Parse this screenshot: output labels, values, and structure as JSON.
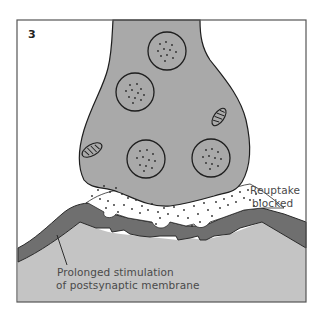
{
  "figure": {
    "panel_number": "3",
    "labels": {
      "reuptake_line1": "Reuptake",
      "reuptake_line2": "blocked",
      "stimulation_line1": "Prolonged stimulation",
      "stimulation_line2": "of postsynaptic membrane"
    },
    "structures": [
      "presynaptic-terminal",
      "synaptic-vesicles",
      "mitochondria",
      "neurotransmitter-molecules",
      "postsynaptic-membrane",
      "postsynaptic-cell"
    ],
    "colors": {
      "background": "#ffffff",
      "terminal_fill": "#a9a9a9",
      "membrane_fill": "#6f6f6f",
      "postsynaptic_fill": "#c4c4c4",
      "outline": "#1e1e1e",
      "frame": "#555555",
      "text": "#4a4a4a"
    }
  }
}
